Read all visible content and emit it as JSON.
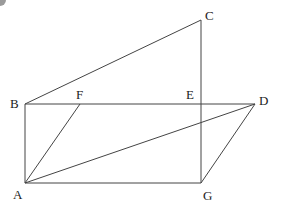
{
  "diagram": {
    "type": "geometry-figure",
    "stroke_color": "#444444",
    "corner_mark_color": "#9a9a9a",
    "points": {
      "A": {
        "x": 25,
        "y": 183,
        "label": "A",
        "lx": 13,
        "ly": 199
      },
      "B": {
        "x": 25,
        "y": 104,
        "label": "B",
        "lx": 10,
        "ly": 108
      },
      "C": {
        "x": 201,
        "y": 20,
        "label": "C",
        "lx": 205,
        "ly": 20
      },
      "D": {
        "x": 255,
        "y": 104,
        "label": "D",
        "lx": 259,
        "ly": 105
      },
      "E": {
        "x": 201,
        "y": 104,
        "label": "E",
        "lx": 186,
        "ly": 99
      },
      "F": {
        "x": 80,
        "y": 104,
        "label": "F",
        "lx": 76,
        "ly": 99
      },
      "G": {
        "x": 201,
        "y": 183,
        "label": "G",
        "lx": 203,
        "ly": 200
      }
    },
    "segments": [
      [
        "B",
        "C"
      ],
      [
        "C",
        "G"
      ],
      [
        "B",
        "D"
      ],
      [
        "B",
        "A"
      ],
      [
        "A",
        "G"
      ],
      [
        "A",
        "F"
      ],
      [
        "A",
        "D"
      ],
      [
        "D",
        "G"
      ]
    ]
  }
}
